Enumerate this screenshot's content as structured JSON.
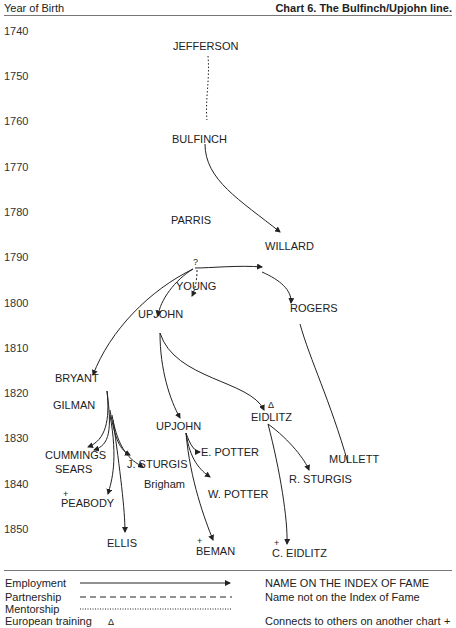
{
  "header": {
    "left": "Year of Birth",
    "title": "Chart 6.  The Bulfinch/Upjohn line."
  },
  "years": [
    "1740",
    "1750",
    "1760",
    "1770",
    "1780",
    "1790",
    "1800",
    "1810",
    "1820",
    "1830",
    "1840",
    "1850"
  ],
  "nodes": {
    "jefferson": "JEFFERSON",
    "bulfinch": "BULFINCH",
    "parris": "PARRIS",
    "willard": "WILLARD",
    "q": "?",
    "young": "YOUNG",
    "upjohn1": "UPJOHN",
    "rogers": "ROGERS",
    "bryant": "BRYANT",
    "gilman": "GILMAN",
    "upjohn2": "UPJOHN",
    "delta": "Δ",
    "eidlitz": "EIDLITZ",
    "cummings": "CUMMINGS",
    "sears": "SEARS",
    "jsturgis": "J. STURGIS",
    "brigham": "Brigham",
    "epotter": "E. POTTER",
    "wpotter": "W. POTTER",
    "mullett": "MULLETT",
    "rsturgis": "R. STURGIS",
    "plus": "+",
    "peabody": "PEABODY",
    "ellis": "ELLIS",
    "beman": "BEMAN",
    "ceidlitz": "C. EIDLITZ"
  },
  "legend": {
    "employment": "Employment",
    "partnership": "Partnership",
    "mentorship": "Mentorship",
    "european": "European training",
    "european_sym": "Δ",
    "index_fame": "NAME ON THE INDEX OF FAME",
    "not_index": "Name not on the Index of Fame",
    "connects": "Connects to others on another chart",
    "connects_sym": "+"
  }
}
